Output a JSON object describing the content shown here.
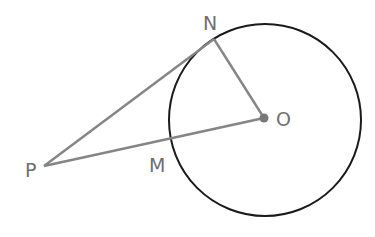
{
  "diagram": {
    "type": "geometry",
    "colors": {
      "circle": "#1a1a1a",
      "segments": "#858585",
      "labels": "#6f6f6f",
      "center_dot": "#777777"
    },
    "circle": {
      "center": "O",
      "cx": 265,
      "cy": 120,
      "r": 96
    },
    "points": [
      {
        "name": "N",
        "label": "N",
        "x": 214,
        "y": 39,
        "label_x": 203,
        "label_y": 30
      },
      {
        "name": "O",
        "label": "O",
        "x": 264,
        "y": 118,
        "label_x": 276,
        "label_y": 125
      },
      {
        "name": "P",
        "label": "P",
        "x": 44,
        "y": 166,
        "label_x": 25,
        "label_y": 177
      },
      {
        "name": "M",
        "label": "M",
        "x": 172,
        "y": 141,
        "label_x": 149,
        "label_y": 172
      }
    ],
    "segments": [
      {
        "name": "PN",
        "from": "P",
        "to": "N"
      },
      {
        "name": "PO",
        "from": "P",
        "to": "O"
      },
      {
        "name": "NO",
        "from": "N",
        "to": "O"
      }
    ]
  }
}
